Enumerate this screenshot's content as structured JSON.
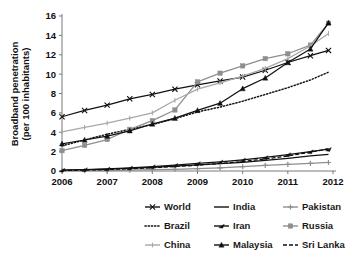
{
  "chart_data": {
    "type": "line",
    "title": "",
    "xlabel": "",
    "ylabel": "Broadband penetration\n(per 100 inhabitants)",
    "ylabel_line1": "Broadband penetration",
    "ylabel_line2": "(per 100 inhabitants)",
    "xlim": [
      2006,
      2012
    ],
    "ylim": [
      0,
      16
    ],
    "ytick_labels": [
      "0",
      "2",
      "4",
      "6",
      "8",
      "10",
      "12",
      "14",
      "16"
    ],
    "yticks": [
      0,
      2,
      4,
      6,
      8,
      10,
      12,
      14,
      16
    ],
    "xtick_labels": [
      "2006",
      "2007",
      "2008",
      "2009",
      "2010",
      "2011",
      "2012"
    ],
    "xticks": [
      2006,
      2007,
      2008,
      2009,
      2010,
      2011,
      2012
    ],
    "grid": false,
    "legend_position": "bottom",
    "x": [
      2006.0,
      2006.5,
      2007.0,
      2007.5,
      2008.0,
      2008.5,
      2009.0,
      2009.5,
      2010.0,
      2010.5,
      2011.0,
      2011.5,
      2011.9
    ],
    "series": [
      {
        "name": "World",
        "color": "#111111",
        "marker": "x-cross",
        "dash": "solid",
        "values": [
          5.6,
          6.25,
          6.8,
          7.45,
          7.9,
          8.45,
          8.9,
          9.3,
          9.7,
          10.4,
          11.2,
          11.9,
          12.45
        ]
      },
      {
        "name": "India",
        "color": "#111111",
        "marker": "none",
        "dash": "solid",
        "values": [
          0.08,
          0.12,
          0.2,
          0.28,
          0.38,
          0.5,
          0.62,
          0.75,
          0.9,
          1.1,
          1.3,
          1.55,
          1.72
        ]
      },
      {
        "name": "Pakistan",
        "color": "#8e8e8e",
        "marker": "plus-dot",
        "dash": "solid",
        "values": [
          0.02,
          0.03,
          0.05,
          0.09,
          0.13,
          0.18,
          0.25,
          0.33,
          0.45,
          0.58,
          0.68,
          0.78,
          0.88
        ]
      },
      {
        "name": "Brazil",
        "color": "#111111",
        "marker": "none",
        "dash": "dotted",
        "values": [
          2.6,
          3.2,
          3.8,
          4.3,
          4.8,
          5.4,
          6.1,
          6.6,
          7.2,
          7.9,
          8.6,
          9.4,
          10.2
        ]
      },
      {
        "name": "Iran",
        "color": "#111111",
        "marker": "flag",
        "dash": "solid",
        "values": [
          0.1,
          0.15,
          0.22,
          0.32,
          0.45,
          0.6,
          0.78,
          0.95,
          1.15,
          1.4,
          1.7,
          2.0,
          2.25
        ]
      },
      {
        "name": "Russia",
        "color": "#8e8e8e",
        "marker": "square",
        "dash": "solid",
        "values": [
          2.1,
          2.65,
          3.25,
          4.3,
          5.2,
          6.3,
          9.2,
          10.1,
          10.85,
          11.6,
          12.1,
          13.0,
          15.25
        ]
      },
      {
        "name": "China",
        "color": "#a8a8a8",
        "marker": "tick",
        "dash": "solid",
        "values": [
          4.05,
          4.5,
          4.95,
          5.45,
          6.0,
          7.3,
          8.45,
          9.1,
          9.8,
          10.6,
          11.6,
          12.9,
          14.2
        ]
      },
      {
        "name": "Malaysia",
        "color": "#111111",
        "marker": "triangle",
        "dash": "solid",
        "values": [
          2.8,
          3.2,
          3.6,
          4.15,
          4.85,
          5.45,
          6.25,
          7.0,
          8.5,
          9.6,
          11.2,
          12.6,
          15.3
        ]
      },
      {
        "name": "Sri Lanka",
        "color": "#111111",
        "marker": "none",
        "dash": "dashed",
        "values": [
          0.05,
          0.09,
          0.15,
          0.23,
          0.33,
          0.46,
          0.6,
          0.78,
          0.98,
          1.25,
          1.55,
          1.95,
          2.3
        ]
      }
    ]
  },
  "legend": {
    "rows": [
      [
        {
          "label": "World",
          "key": "World"
        },
        {
          "label": "India",
          "key": "India"
        },
        {
          "label": "Pakistan",
          "key": "Pakistan"
        }
      ],
      [
        {
          "label": "Brazil",
          "key": "Brazil"
        },
        {
          "label": "Iran",
          "key": "Iran"
        },
        {
          "label": "Russia",
          "key": "Russia"
        }
      ],
      [
        {
          "label": "China",
          "key": "China"
        },
        {
          "label": "Malaysia",
          "key": "Malaysia"
        },
        {
          "label": "Sri Lanka",
          "key": "Sri Lanka"
        }
      ]
    ]
  }
}
